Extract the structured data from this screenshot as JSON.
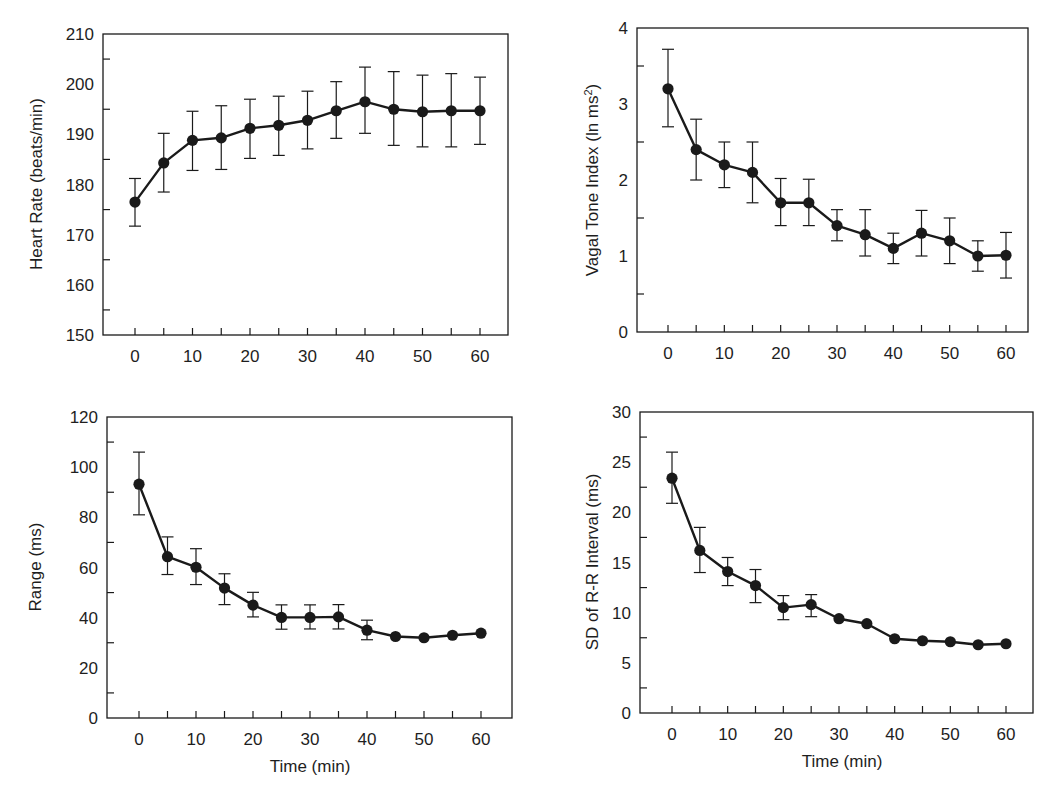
{
  "chart_data": [
    {
      "id": "heart_rate",
      "type": "line",
      "title": "",
      "xlabel": "",
      "ylabel": "Heart Rate (beats/min)",
      "ylim": [
        150,
        210
      ],
      "xlim": [
        -5,
        65
      ],
      "yticks": [
        150,
        160,
        170,
        180,
        190,
        200,
        210
      ],
      "xticks": [
        0,
        10,
        20,
        30,
        40,
        50,
        60
      ],
      "grid": false,
      "legend": null,
      "x": [
        0,
        5,
        10,
        15,
        20,
        25,
        30,
        35,
        40,
        45,
        50,
        55,
        60
      ],
      "series": [
        {
          "name": "Heart Rate",
          "marker": "filled-circle",
          "values": [
            176.5,
            184.3,
            188.8,
            189.3,
            191.2,
            191.8,
            192.8,
            194.7,
            196.5,
            195.0,
            194.5,
            194.7,
            194.7
          ],
          "error_low": [
            171.7,
            178.5,
            182.8,
            183.0,
            185.2,
            185.8,
            187.1,
            189.2,
            190.2,
            187.8,
            187.5,
            187.5,
            188.0
          ],
          "error_high": [
            181.2,
            190.2,
            194.6,
            195.7,
            197.0,
            197.6,
            198.6,
            200.5,
            203.4,
            202.5,
            201.8,
            202.1,
            201.4
          ]
        }
      ],
      "frame": {
        "left": 103,
        "top": 34,
        "right": 508,
        "bottom": 335
      },
      "x0px": 135,
      "x60px": 480
    },
    {
      "id": "vagal_tone",
      "type": "line",
      "title": "",
      "xlabel": "",
      "ylabel": "Vagal Tone Index (ln ms²)",
      "ylabel_main": "Vagal Tone Index (ln ms",
      "ylabel_sup": "2",
      "ylabel_close": ")",
      "ylim": [
        0,
        4
      ],
      "xlim": [
        -5,
        65
      ],
      "yticks": [
        0,
        1,
        2,
        3,
        4
      ],
      "xticks": [
        0,
        10,
        20,
        30,
        40,
        50,
        60
      ],
      "grid": false,
      "legend": null,
      "x": [
        0,
        5,
        10,
        15,
        20,
        25,
        30,
        35,
        40,
        45,
        50,
        55,
        60
      ],
      "series": [
        {
          "name": "Vagal Tone Index",
          "marker": "filled-circle",
          "values": [
            3.2,
            2.4,
            2.2,
            2.1,
            1.7,
            1.7,
            1.4,
            1.28,
            1.1,
            1.3,
            1.2,
            1.0,
            1.01
          ],
          "error_low": [
            2.7,
            2.0,
            1.9,
            1.7,
            1.4,
            1.4,
            1.2,
            1.0,
            0.9,
            1.0,
            0.9,
            0.8,
            0.71
          ],
          "error_high": [
            3.72,
            2.8,
            2.5,
            2.5,
            2.02,
            2.01,
            1.61,
            1.61,
            1.3,
            1.6,
            1.5,
            1.2,
            1.31
          ]
        }
      ],
      "frame": {
        "left": 637,
        "top": 28,
        "right": 1028,
        "bottom": 332
      },
      "x0px": 668,
      "x60px": 1006
    },
    {
      "id": "range",
      "type": "line",
      "title": "",
      "xlabel": "Time (min)",
      "ylabel": "Range (ms)",
      "ylim": [
        0,
        120
      ],
      "xlim": [
        -5,
        65
      ],
      "yticks": [
        0,
        20,
        40,
        60,
        80,
        100,
        120
      ],
      "ytick_labels": [
        "0",
        "",
        "40",
        "",
        "80",
        "",
        "120"
      ],
      "ytick_labels_all": [
        "0",
        "20",
        "40",
        "60",
        "80",
        "100",
        "120"
      ],
      "xticks": [
        0,
        10,
        20,
        30,
        40,
        50,
        60
      ],
      "grid": false,
      "legend": null,
      "x": [
        0,
        5,
        10,
        15,
        20,
        25,
        30,
        35,
        40,
        45,
        50,
        55,
        60
      ],
      "series": [
        {
          "name": "Range",
          "marker": "filled-circle",
          "values": [
            93.2,
            64.3,
            60.1,
            51.8,
            45.0,
            40.1,
            40.1,
            40.3,
            35.0,
            32.5,
            32.0,
            33.0,
            33.8
          ],
          "error_low": [
            81.0,
            57.2,
            53.2,
            45.2,
            40.3,
            35.4,
            35.5,
            35.5,
            31.2,
            null,
            null,
            null,
            null
          ],
          "error_high": [
            106.0,
            72.2,
            67.5,
            57.5,
            50.1,
            45.1,
            45.1,
            45.2,
            39.0,
            null,
            null,
            null,
            null
          ]
        }
      ],
      "frame": {
        "left": 107,
        "top": 417,
        "right": 512,
        "bottom": 718
      },
      "x0px": 139,
      "x60px": 481
    },
    {
      "id": "sd_rr",
      "type": "line",
      "title": "",
      "xlabel": "Time (min)",
      "ylabel": "SD of R-R Interval (ms)",
      "ylim": [
        0,
        30
      ],
      "xlim": [
        -5,
        65
      ],
      "yticks": [
        0,
        5,
        10,
        15,
        20,
        25,
        30
      ],
      "xticks": [
        0,
        10,
        20,
        30,
        40,
        50,
        60
      ],
      "grid": false,
      "legend": null,
      "x": [
        0,
        5,
        10,
        15,
        20,
        25,
        30,
        35,
        40,
        45,
        50,
        55,
        60
      ],
      "series": [
        {
          "name": "SD of R-R Interval",
          "marker": "filled-circle",
          "values": [
            23.4,
            16.2,
            14.1,
            12.7,
            10.5,
            10.8,
            9.4,
            8.9,
            7.4,
            7.2,
            7.1,
            6.8,
            6.9
          ],
          "error_low": [
            20.9,
            14.0,
            12.7,
            11.0,
            9.3,
            9.6,
            null,
            null,
            null,
            null,
            null,
            null,
            null
          ],
          "error_high": [
            26.0,
            18.5,
            15.5,
            14.3,
            11.7,
            11.8,
            null,
            null,
            null,
            null,
            null,
            null,
            null
          ]
        }
      ],
      "frame": {
        "left": 640,
        "top": 412,
        "right": 1033,
        "bottom": 713
      },
      "x0px": 672,
      "x60px": 1006
    }
  ],
  "labels": {
    "hr_ylabel": "Heart Rate (beats/min)",
    "vt_ylabel_main": "Vagal Tone Index (ln ms",
    "vt_ylabel_sup": "2",
    "vt_ylabel_close": ")",
    "range_ylabel": "Range (ms)",
    "sd_ylabel": "SD of R-R Interval (ms)",
    "range_xlabel": "Time (min)",
    "sd_xlabel": "Time (min)"
  },
  "style": {
    "ink": "#1a1a1a",
    "background": "#ffffff"
  }
}
